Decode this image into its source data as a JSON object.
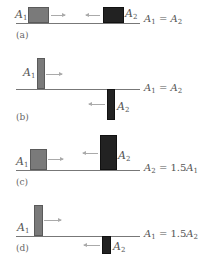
{
  "panels": [
    {
      "tag": "(a)",
      "pulse1_label": "A",
      "pulse1_sub": "1",
      "pulse2_label": "A",
      "pulse2_sub": "2",
      "equation": {
        "lhs": "A",
        "lhs_sub": "1",
        "op": " = ",
        "coef": "",
        "rhs": "A",
        "rhs_sub": "2"
      },
      "pulse1": {
        "shape": "square",
        "side": "above",
        "direction": "right"
      },
      "pulse2": {
        "shape": "square",
        "side": "above",
        "direction": "left"
      }
    },
    {
      "tag": "(b)",
      "pulse1_label": "A",
      "pulse1_sub": "1",
      "pulse2_label": "A",
      "pulse2_sub": "2",
      "equation": {
        "lhs": "A",
        "lhs_sub": "1",
        "op": " = ",
        "coef": "",
        "rhs": "A",
        "rhs_sub": "2"
      },
      "pulse1": {
        "shape": "tall-narrow",
        "side": "above",
        "direction": "right"
      },
      "pulse2": {
        "shape": "tall-narrow",
        "side": "below",
        "direction": "left"
      }
    },
    {
      "tag": "(c)",
      "pulse1_label": "A",
      "pulse1_sub": "1",
      "pulse2_label": "A",
      "pulse2_sub": "2",
      "equation": {
        "lhs": "A",
        "lhs_sub": "2",
        "op": " = ",
        "coef": "1.5",
        "rhs": "A",
        "rhs_sub": "1"
      },
      "pulse1": {
        "shape": "square",
        "side": "above",
        "direction": "right"
      },
      "pulse2": {
        "shape": "tall",
        "side": "above",
        "direction": "left"
      }
    },
    {
      "tag": "(d)",
      "pulse1_label": "A",
      "pulse1_sub": "1",
      "pulse2_label": "A",
      "pulse2_sub": "2",
      "equation": {
        "lhs": "A",
        "lhs_sub": "1",
        "op": " = ",
        "coef": "1.5",
        "rhs": "A",
        "rhs_sub": "2"
      },
      "pulse1": {
        "shape": "tall-narrow",
        "side": "above",
        "direction": "right"
      },
      "pulse2": {
        "shape": "short-narrow",
        "side": "below",
        "direction": "left"
      }
    }
  ],
  "colors": {
    "pulse1": "#7a7a7a",
    "pulse2": "#222222",
    "baseline": "#777777",
    "arrow": "#aaaaaa"
  }
}
